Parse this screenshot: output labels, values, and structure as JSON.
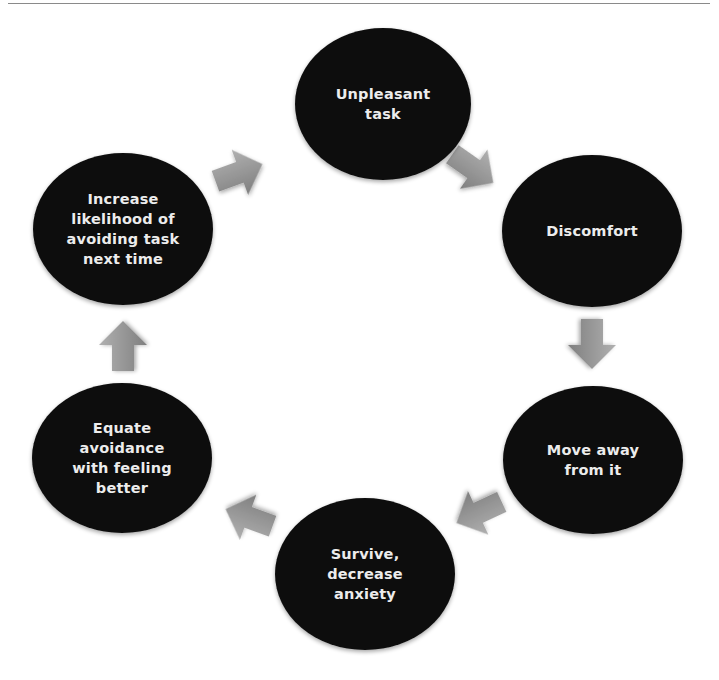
{
  "diagram": {
    "type": "cycle",
    "colors": {
      "node_fill": "#111111",
      "node_text": "#ececec",
      "arrow_fill_light": "#b0b0b0",
      "arrow_fill_dark": "#7f7f7f",
      "rule": "#8a8a8a"
    },
    "nodes": [
      {
        "id": "unpleasant-task",
        "lines": [
          "Unpleasant",
          "task"
        ]
      },
      {
        "id": "discomfort",
        "lines": [
          "Discomfort"
        ]
      },
      {
        "id": "move-away",
        "lines": [
          "Move away",
          "from it"
        ]
      },
      {
        "id": "survive",
        "lines": [
          "Survive,",
          "decrease",
          "anxiety"
        ]
      },
      {
        "id": "equate-avoidance",
        "lines": [
          "Equate",
          "avoidance",
          "with feeling",
          "better"
        ]
      },
      {
        "id": "increase-likelihood",
        "lines": [
          "Increase",
          "likelihood of",
          "avoiding task",
          "next time"
        ]
      }
    ],
    "edges": [
      {
        "from": "unpleasant-task",
        "to": "discomfort"
      },
      {
        "from": "discomfort",
        "to": "move-away"
      },
      {
        "from": "move-away",
        "to": "survive"
      },
      {
        "from": "survive",
        "to": "equate-avoidance"
      },
      {
        "from": "equate-avoidance",
        "to": "increase-likelihood"
      },
      {
        "from": "increase-likelihood",
        "to": "unpleasant-task"
      }
    ]
  }
}
